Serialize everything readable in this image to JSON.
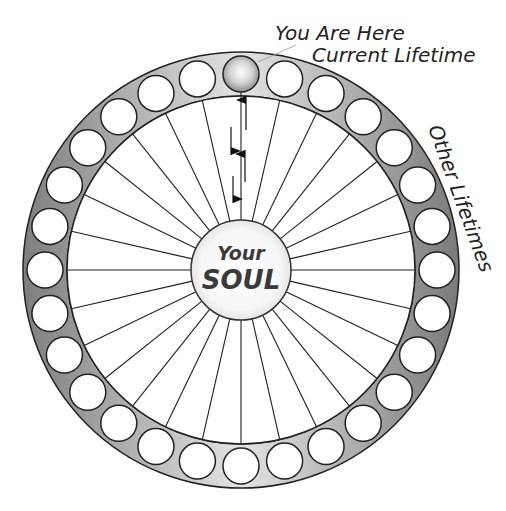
{
  "diagram": {
    "title_line1": "You Are Here",
    "title_line2": "Current Lifetime",
    "side_label": "Other Lifetimes",
    "center": {
      "line1": "Your",
      "line2": "SOUL"
    },
    "wheel": {
      "center_x": 241,
      "center_y": 270,
      "outer_radius": 218,
      "inner_radius": 174,
      "hub_radius": 50,
      "lifetime_circle_radius": 18,
      "lifetime_count": 28,
      "current_index": 0
    },
    "colors": {
      "ring_light": "#e8e8e8",
      "ring_dark": "#8a8a8a",
      "stroke": "#222222",
      "current_ball_highlight": "#ffffff",
      "current_ball_shadow": "#8c8c8c",
      "text": "#222222",
      "soul_text": "#3a3a3a"
    },
    "arrows": [
      {
        "direction": "up",
        "x": 246,
        "y1": 130,
        "y2": 96
      },
      {
        "direction": "down",
        "x": 231,
        "y1": 127,
        "y2": 155
      },
      {
        "direction": "up",
        "x": 245,
        "y1": 182,
        "y2": 150
      },
      {
        "direction": "down",
        "x": 233,
        "y1": 176,
        "y2": 203
      }
    ]
  }
}
